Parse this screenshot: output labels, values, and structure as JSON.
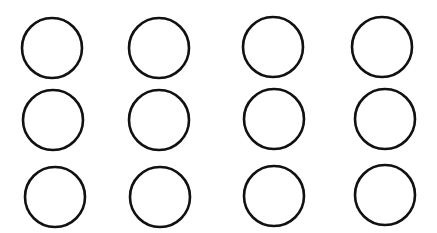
{
  "diagram": {
    "background": "#ffffff",
    "stroke_color": "#111111",
    "fill_color": "#ffffff",
    "stroke_width": 2.6,
    "radius": 30,
    "rows": 3,
    "cols": 4,
    "circles": [
      {
        "row": 1,
        "col": 1,
        "cx": 52,
        "cy": 48
      },
      {
        "row": 1,
        "col": 2,
        "cx": 159,
        "cy": 48
      },
      {
        "row": 1,
        "col": 3,
        "cx": 273,
        "cy": 47
      },
      {
        "row": 1,
        "col": 4,
        "cx": 382,
        "cy": 47
      },
      {
        "row": 2,
        "col": 1,
        "cx": 53,
        "cy": 120
      },
      {
        "row": 2,
        "col": 2,
        "cx": 159,
        "cy": 120
      },
      {
        "row": 2,
        "col": 3,
        "cx": 274,
        "cy": 119
      },
      {
        "row": 2,
        "col": 4,
        "cx": 385,
        "cy": 119
      },
      {
        "row": 3,
        "col": 1,
        "cx": 55,
        "cy": 197
      },
      {
        "row": 3,
        "col": 2,
        "cx": 160,
        "cy": 197
      },
      {
        "row": 3,
        "col": 3,
        "cx": 274,
        "cy": 196
      },
      {
        "row": 3,
        "col": 4,
        "cx": 385,
        "cy": 195
      }
    ]
  }
}
